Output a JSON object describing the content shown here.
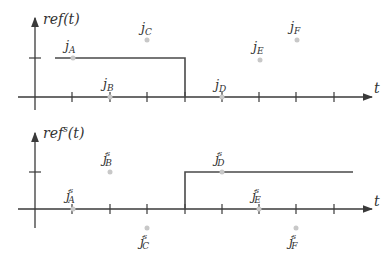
{
  "top_plot": {
    "ylabel": "ref(t)",
    "xlabel": "t",
    "points": [
      {
        "name": "j",
        "sub": "A",
        "sup": ""
      },
      {
        "name": "j",
        "sub": "B",
        "sup": ""
      },
      {
        "name": "j",
        "sub": "C",
        "sup": ""
      },
      {
        "name": "j",
        "sub": "D",
        "sup": ""
      },
      {
        "name": "j",
        "sub": "E",
        "sup": ""
      },
      {
        "name": "j",
        "sub": "F",
        "sup": ""
      }
    ],
    "signal": "high from t≈0.5 to t=4, then zero"
  },
  "bottom_plot": {
    "ylabel_base": "ref",
    "ylabel_sup": "s",
    "ylabel_arg": "(t)",
    "xlabel": "t",
    "points": [
      {
        "name": "j",
        "sub": "A",
        "sup": "s"
      },
      {
        "name": "j",
        "sub": "B",
        "sup": "s"
      },
      {
        "name": "j",
        "sub": "C",
        "sup": "s"
      },
      {
        "name": "j",
        "sub": "D",
        "sup": "s"
      },
      {
        "name": "j",
        "sub": "E",
        "sup": "s"
      },
      {
        "name": "j",
        "sub": "F",
        "sup": "s"
      }
    ],
    "signal": "zero until t=4, then high"
  }
}
